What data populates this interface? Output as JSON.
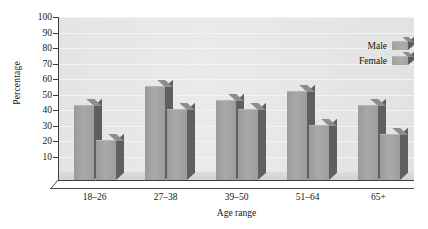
{
  "chart_data": {
    "type": "bar",
    "title": "",
    "subtitle": "",
    "xlabel": "Age range",
    "ylabel": "Percentage",
    "categories": [
      "18–26",
      "27–38",
      "39–50",
      "51–64",
      "65+"
    ],
    "series": [
      {
        "name": "Male",
        "values": [
          48,
          60,
          51,
          57,
          48
        ]
      },
      {
        "name": "Female",
        "values": [
          25,
          45,
          45,
          35,
          29
        ]
      }
    ],
    "ylim": [
      0,
      100
    ],
    "y_ticks": [
      100,
      90,
      80,
      70,
      60,
      50,
      40,
      30,
      20,
      10
    ],
    "y_tick_labels": [
      "100",
      "90",
      "80",
      "70",
      "60",
      "50",
      "40",
      "30",
      "20",
      "10"
    ],
    "grid": true,
    "grid_axis": "y",
    "legend_position": "top-right",
    "style": "3d",
    "colors": {
      "bar_face": "#a9a9a7",
      "bar_side": "#5f5f5d",
      "bar_top": "#8d8d8b",
      "plot_background": "#e8e8e6",
      "gridline": "#f4f4f2",
      "axis": "#3d3d3d",
      "text": "#141414",
      "page_background": "#ffffff"
    }
  },
  "legend": {
    "entries": [
      {
        "label": "Male"
      },
      {
        "label": "Female"
      }
    ]
  }
}
